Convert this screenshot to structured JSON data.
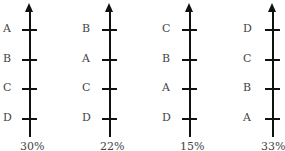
{
  "axes": [
    {
      "labels_top_to_bottom": [
        "A",
        "B",
        "C",
        "D"
      ],
      "percent": "30%"
    },
    {
      "labels_top_to_bottom": [
        "B",
        "A",
        "C",
        "D"
      ],
      "percent": "22%"
    },
    {
      "labels_top_to_bottom": [
        "C",
        "B",
        "A",
        "D"
      ],
      "percent": "15%"
    },
    {
      "labels_top_to_bottom": [
        "D",
        "C",
        "B",
        "A"
      ],
      "percent": "33%"
    }
  ]
}
